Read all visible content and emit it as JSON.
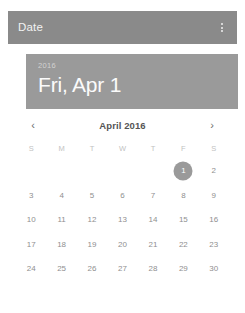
{
  "appbar": {
    "title": "Date",
    "overflow_icon": "more-vert-icon"
  },
  "date_header": {
    "year": "2016",
    "date": "Fri, Apr 1"
  },
  "month_nav": {
    "prev_icon": "‹",
    "next_icon": "›",
    "month_label": "April 2016"
  },
  "calendar": {
    "weekdays": [
      "S",
      "M",
      "T",
      "W",
      "T",
      "F",
      "S"
    ],
    "weeks": [
      [
        "",
        "",
        "",
        "",
        "",
        "1",
        "2"
      ],
      [
        "3",
        "4",
        "5",
        "6",
        "7",
        "8",
        "9"
      ],
      [
        "10",
        "11",
        "12",
        "13",
        "14",
        "15",
        "16"
      ],
      [
        "17",
        "18",
        "19",
        "20",
        "21",
        "22",
        "23"
      ],
      [
        "24",
        "25",
        "26",
        "27",
        "28",
        "29",
        "30"
      ]
    ],
    "selected_day": "1"
  },
  "colors": {
    "appbar_bg": "#8a8a8a",
    "banner_bg": "#9a9a9a",
    "selection": "#9a9a9a",
    "card_bg": "#ffffff"
  }
}
